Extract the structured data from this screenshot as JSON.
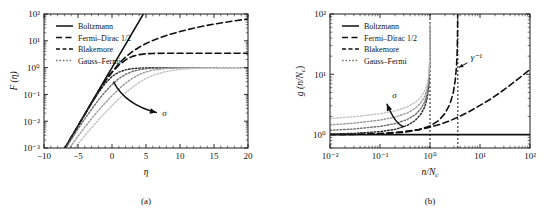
{
  "figure": {
    "background": "#ffffff",
    "ink": "#1a1a1a"
  },
  "chart_data": [
    {
      "id": "panel-a",
      "type": "line",
      "panel_label": "(a)",
      "title": "",
      "xlabel": "η",
      "ylabel": "F (η)",
      "xscale": "linear",
      "yscale": "log",
      "xlim": [
        -10,
        20
      ],
      "ylim": [
        0.001,
        100
      ],
      "xticks": [
        -10,
        -5,
        0,
        5,
        10,
        15,
        20
      ],
      "xticklabels": [
        "−10",
        "−5",
        "0",
        "5",
        "10",
        "15",
        "20"
      ],
      "yticks": [
        0.001,
        0.01,
        0.1,
        1,
        10,
        100
      ],
      "yticklabels": [
        "10⁻³",
        "10⁻²",
        "10⁻¹",
        "10⁰",
        "10¹",
        "10²"
      ],
      "grid": false,
      "legend_position": "upper-left",
      "legend": [
        {
          "label": "Boltzmann",
          "style": "solid",
          "color": "#111111"
        },
        {
          "label": "Fermi–Dirac 1/2",
          "style": "dashed",
          "color": "#111111"
        },
        {
          "label": "Blakemore",
          "style": "dashed-short",
          "color": "#111111"
        },
        {
          "label": "Gauss–Fermi",
          "style": "dotted",
          "color": "#777777"
        }
      ],
      "annotations": [
        {
          "text": "σ",
          "x": 7.4,
          "y": 0.016,
          "name": "sigma-annotation"
        }
      ],
      "series": [
        {
          "name": "Boltzmann",
          "style": "solid",
          "color": "#111111",
          "width": 1.6,
          "x": [
            -7.0,
            -6.0,
            -5.0,
            -4.0,
            -3.0,
            -2.0,
            -1.0,
            0.0,
            1.0,
            2.0,
            3.0,
            4.0,
            4.6
          ],
          "y": [
            0.000912,
            0.00248,
            0.00674,
            0.0183,
            0.0498,
            0.135,
            0.368,
            1.0,
            2.718,
            7.389,
            20.09,
            54.6,
            99.5
          ]
        },
        {
          "name": "Fermi-Dirac 1/2",
          "style": "dashed",
          "color": "#111111",
          "width": 1.6,
          "x": [
            -7,
            -6,
            -5,
            -4,
            -3,
            -2,
            -1,
            0,
            1,
            2,
            3,
            4,
            5,
            6,
            7,
            8,
            10,
            12,
            14,
            16,
            18,
            20
          ],
          "y": [
            0.00091,
            0.00247,
            0.0067,
            0.0181,
            0.0489,
            0.13,
            0.338,
            0.678,
            1.396,
            2.502,
            3.98,
            5.77,
            7.88,
            10.3,
            12.9,
            15.8,
            22.3,
            29.6,
            37.6,
            46.3,
            55.5,
            65.2
          ]
        },
        {
          "name": "Blakemore",
          "style": "dashed",
          "color": "#111111",
          "width": 1.6,
          "x": [
            -7,
            -6,
            -5,
            -4,
            -3,
            -2,
            -1,
            0,
            1,
            2,
            3,
            4,
            5,
            6,
            8,
            10,
            12,
            14,
            16,
            18,
            20
          ],
          "y": [
            0.000911,
            0.00247,
            0.00669,
            0.018,
            0.0485,
            0.127,
            0.313,
            0.667,
            1.23,
            1.96,
            2.62,
            3.05,
            3.28,
            3.38,
            3.44,
            3.45,
            3.45,
            3.45,
            3.45,
            3.45,
            3.45
          ]
        },
        {
          "name": "Gauss-Fermi sigma1",
          "style": "dotted",
          "color": "#2a2a2a",
          "width": 1.4,
          "sigma": 1,
          "x": [
            -7,
            -6,
            -5,
            -4,
            -3,
            -2,
            -1,
            0,
            1,
            2,
            3,
            4,
            5,
            6,
            8,
            10,
            12,
            14,
            16,
            18,
            20
          ],
          "y": [
            0.00091,
            0.00246,
            0.0066,
            0.0176,
            0.0462,
            0.115,
            0.257,
            0.466,
            0.676,
            0.826,
            0.913,
            0.958,
            0.98,
            0.991,
            0.998,
            0.9995,
            0.9999,
            1.0,
            1.0,
            1.0,
            1.0
          ]
        },
        {
          "name": "Gauss-Fermi sigma2",
          "style": "dotted",
          "color": "#6e6e6e",
          "width": 1.4,
          "sigma": 2,
          "x": [
            -7,
            -6,
            -5,
            -4,
            -3,
            -2,
            -1,
            0,
            1,
            2,
            3,
            4,
            5,
            6,
            8,
            10,
            12,
            14,
            16,
            18,
            20
          ],
          "y": [
            0.0008,
            0.00205,
            0.0051,
            0.0122,
            0.0281,
            0.0615,
            0.125,
            0.233,
            0.388,
            0.562,
            0.718,
            0.833,
            0.907,
            0.95,
            0.987,
            0.9968,
            0.9992,
            0.9998,
            1.0,
            1.0,
            1.0
          ]
        },
        {
          "name": "Gauss-Fermi sigma3",
          "style": "dotted",
          "color": "#9a9a9a",
          "width": 1.4,
          "sigma": 3,
          "x": [
            -7,
            -6,
            -5,
            -4,
            -3,
            -2,
            -1,
            0,
            1,
            2,
            3,
            4,
            5,
            6,
            8,
            10,
            12,
            14,
            16,
            18,
            20
          ],
          "y": [
            0.00052,
            0.00122,
            0.00275,
            0.00598,
            0.0125,
            0.0251,
            0.0483,
            0.0892,
            0.157,
            0.262,
            0.4,
            0.552,
            0.694,
            0.806,
            0.934,
            0.979,
            0.9938,
            0.9982,
            0.9995,
            0.9999,
            1.0
          ]
        },
        {
          "name": "Gauss-Fermi sigma4",
          "style": "dotted",
          "color": "#c4c4c4",
          "width": 1.4,
          "sigma": 4,
          "x": [
            -7,
            -6,
            -5,
            -4,
            -3,
            -2,
            -1,
            0,
            1,
            2,
            3,
            4,
            5,
            6,
            8,
            10,
            12,
            14,
            16,
            18,
            20
          ],
          "y": [
            0.0003,
            0.00066,
            0.0014,
            0.00288,
            0.00574,
            0.0111,
            0.0209,
            0.0381,
            0.0672,
            0.114,
            0.185,
            0.28,
            0.394,
            0.514,
            0.724,
            0.858,
            0.93,
            0.968,
            0.985,
            0.993,
            0.997
          ]
        }
      ]
    },
    {
      "id": "panel-b",
      "type": "line",
      "panel_label": "(b)",
      "title": "",
      "xlabel": "n/N",
      "xlabel_sub": "c",
      "ylabel": "g (n/N",
      "ylabel_sub": "c",
      "xscale": "log",
      "yscale": "log",
      "xlim": [
        0.01,
        100
      ],
      "ylim": [
        0.6,
        100
      ],
      "xticks": [
        0.01,
        0.1,
        1,
        10,
        100
      ],
      "xticklabels": [
        "10⁻²",
        "10⁻¹",
        "10⁰",
        "10¹",
        "10²"
      ],
      "yticks": [
        1,
        10,
        100
      ],
      "yticklabels": [
        "10⁰",
        "10¹",
        "10²"
      ],
      "grid": false,
      "legend_position": "upper-left",
      "legend": [
        {
          "label": "Boltzmann",
          "style": "solid",
          "color": "#111111"
        },
        {
          "label": "Fermi–Dirac 1/2",
          "style": "dashed",
          "color": "#111111"
        },
        {
          "label": "Blakemore",
          "style": "dashed-short",
          "color": "#111111"
        },
        {
          "label": "Gauss–Fermi",
          "style": "dotted",
          "color": "#777777"
        }
      ],
      "vlines": [
        {
          "x": 1.0,
          "style": "dotted",
          "color": "#111111",
          "name": "vline-unity"
        },
        {
          "x": 3.6,
          "style": "dotted",
          "color": "#111111",
          "name": "vline-gamma-inverse"
        }
      ],
      "annotations": [
        {
          "text": "γ⁻¹",
          "x": 6.5,
          "y": 17.0,
          "name": "gamma-inverse-annotation"
        },
        {
          "text": "σ",
          "x": 0.175,
          "y": 4.1,
          "name": "sigma-annotation"
        }
      ],
      "series": [
        {
          "name": "Boltzmann",
          "style": "solid",
          "color": "#111111",
          "width": 1.6,
          "x": [
            0.01,
            100
          ],
          "y": [
            1.0,
            1.0
          ]
        },
        {
          "name": "Fermi-Dirac 1/2",
          "style": "dashed",
          "color": "#111111",
          "width": 1.6,
          "x": [
            0.01,
            0.03,
            0.1,
            0.3,
            0.6,
            1.0,
            1.6,
            2.5,
            4.0,
            6.0,
            10,
            16,
            25,
            40,
            60,
            100
          ],
          "y": [
            1.005,
            1.014,
            1.045,
            1.12,
            1.21,
            1.33,
            1.48,
            1.7,
            2.02,
            2.4,
            3.05,
            3.85,
            4.95,
            6.6,
            8.6,
            12.0
          ]
        },
        {
          "name": "Blakemore",
          "style": "dashed",
          "color": "#111111",
          "width": 1.6,
          "x": [
            0.01,
            0.03,
            0.1,
            0.3,
            0.6,
            1.0,
            1.5,
            2.0,
            2.5,
            2.9,
            3.2,
            3.4,
            3.5,
            3.55,
            3.58
          ],
          "y": [
            1.003,
            1.009,
            1.03,
            1.095,
            1.21,
            1.39,
            1.72,
            2.25,
            3.2,
            4.8,
            8.0,
            14.0,
            24.0,
            45.0,
            95.0
          ]
        },
        {
          "name": "Gauss-Fermi sigma1",
          "style": "dotted",
          "color": "#2a2a2a",
          "width": 1.4,
          "sigma": 1,
          "x": [
            0.01,
            0.03,
            0.1,
            0.2,
            0.35,
            0.5,
            0.65,
            0.78,
            0.87,
            0.93,
            0.965,
            0.985,
            0.994,
            0.998
          ],
          "y": [
            1.02,
            1.05,
            1.12,
            1.22,
            1.42,
            1.7,
            2.15,
            2.85,
            3.9,
            5.6,
            8.5,
            14.5,
            28.0,
            62.0
          ]
        },
        {
          "name": "Gauss-Fermi sigma2",
          "style": "dotted",
          "color": "#6e6e6e",
          "width": 1.4,
          "sigma": 2,
          "x": [
            0.01,
            0.03,
            0.1,
            0.2,
            0.35,
            0.5,
            0.65,
            0.78,
            0.87,
            0.93,
            0.965,
            0.985,
            0.994,
            0.998
          ],
          "y": [
            1.18,
            1.24,
            1.37,
            1.52,
            1.78,
            2.12,
            2.65,
            3.45,
            4.6,
            6.4,
            9.4,
            15.5,
            29.0,
            63.0
          ]
        },
        {
          "name": "Gauss-Fermi sigma3",
          "style": "dotted",
          "color": "#9a9a9a",
          "width": 1.4,
          "sigma": 3,
          "x": [
            0.01,
            0.03,
            0.1,
            0.2,
            0.35,
            0.5,
            0.65,
            0.78,
            0.87,
            0.93,
            0.965,
            0.985,
            0.994,
            0.998
          ],
          "y": [
            1.45,
            1.55,
            1.74,
            1.95,
            2.28,
            2.7,
            3.35,
            4.25,
            5.6,
            7.5,
            10.8,
            17.0,
            31.0,
            66.0
          ]
        },
        {
          "name": "Gauss-Fermi sigma4",
          "style": "dotted",
          "color": "#c4c4c4",
          "width": 1.4,
          "sigma": 4,
          "x": [
            0.01,
            0.03,
            0.1,
            0.2,
            0.35,
            0.5,
            0.65,
            0.78,
            0.87,
            0.93,
            0.965,
            0.985,
            0.994,
            0.998
          ],
          "y": [
            1.85,
            1.98,
            2.22,
            2.48,
            2.88,
            3.4,
            4.15,
            5.25,
            6.8,
            8.9,
            12.4,
            19.0,
            33.5,
            69.0
          ]
        }
      ]
    }
  ]
}
